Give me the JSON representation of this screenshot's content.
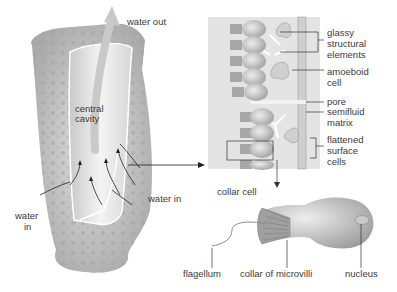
{
  "labels": {
    "water_out": "water out",
    "central_cavity_1": "central",
    "central_cavity_2": "cavity",
    "water_in_left_1": "water",
    "water_in_left_2": "in",
    "water_in_right": "water in",
    "glassy_1": "glassy",
    "glassy_2": "structural",
    "glassy_3": "elements",
    "amoeboid_1": "amoeboid",
    "amoeboid_2": "cell",
    "pore": "pore",
    "semifluid_1": "semifluid",
    "semifluid_2": "matrix",
    "flattened_1": "flattened",
    "flattened_2": "surface",
    "flattened_3": "cells",
    "collar_cell": "collar cell",
    "flagellum": "flagellum",
    "collar_of_microvilli": "collar of microvilli",
    "nucleus": "nucleus"
  },
  "colors": {
    "sponge_body": "#cfcfcf",
    "sponge_dark": "#9a9a9a",
    "panel_bg": "#e6e6e6",
    "cell": "#b8b8b8",
    "line": "#333333"
  }
}
